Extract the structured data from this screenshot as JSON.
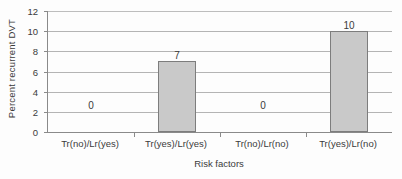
{
  "chart_data": {
    "type": "bar",
    "title": "",
    "xlabel": "Risk factors",
    "ylabel": "Percent recurrent DVT",
    "categories": [
      "Tr(no)/Lr(yes)",
      "Tr(yes)/Lr(yes)",
      "Tr(no)/Lr(no)",
      "Tr(yes)/Lr(no)"
    ],
    "values": [
      0,
      7,
      0,
      10
    ],
    "data_labels": [
      "0",
      "7",
      "0",
      "10"
    ],
    "ylim": [
      0,
      12
    ],
    "yticks": [
      0,
      2,
      4,
      6,
      8,
      10,
      12
    ],
    "ytick_labels": [
      "0",
      "2",
      "4",
      "6",
      "8",
      "10",
      "12"
    ],
    "grid": "horizontal",
    "legend": "none",
    "bar_fill_color": "#c9c9c9",
    "bar_border_color": "#7d7d7d",
    "gridline_color": "#b4b4b4",
    "axis_color": "#8a8a8a"
  }
}
